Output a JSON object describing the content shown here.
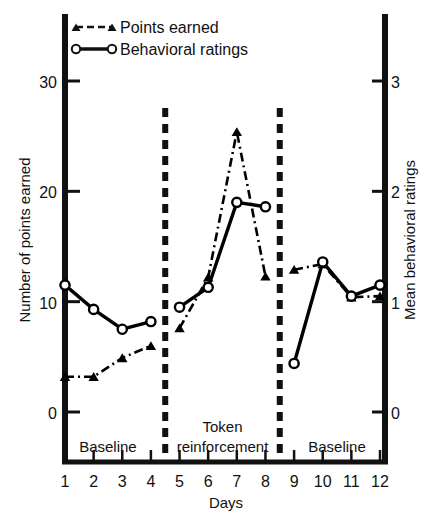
{
  "chart_data": {
    "type": "line",
    "title": "",
    "xlabel": "Days",
    "ylabel_left": "Number of points earned",
    "ylabel_right": "Mean behavioral ratings",
    "x": [
      1,
      2,
      3,
      4,
      5,
      6,
      7,
      8,
      9,
      10,
      11,
      12
    ],
    "xtick_labels": [
      "1",
      "2",
      "3",
      "4",
      "5",
      "6",
      "7",
      "8",
      "9",
      "10",
      "11",
      "12"
    ],
    "xlim": [
      0.6,
      12.4
    ],
    "ylim_left": [
      -1.5,
      34
    ],
    "ylim_right": [
      -0.15,
      3.4
    ],
    "ytick_labels_left": [
      "0",
      "10",
      "20",
      "30"
    ],
    "ytick_values_left": [
      0,
      10,
      20,
      30
    ],
    "ytick_labels_right": [
      "0",
      "1",
      "2",
      "3"
    ],
    "ytick_values_right": [
      0,
      1,
      2,
      3
    ],
    "grid": false,
    "legend_position": "top-left",
    "series": [
      {
        "name": "Points earned",
        "axis": "left",
        "marker": "triangle",
        "linestyle": "dash-dot",
        "color": "#000000",
        "values": [
          3.2,
          3.2,
          4.9,
          6.0,
          7.6,
          12.2,
          25.4,
          12.3,
          12.9,
          13.4,
          10.4,
          10.5
        ],
        "segments": [
          [
            1,
            2,
            3,
            4
          ],
          [
            5,
            6,
            7,
            8
          ],
          [
            9,
            10,
            11,
            12
          ]
        ]
      },
      {
        "name": "Behavioral ratings",
        "axis": "right",
        "marker": "circle",
        "linestyle": "solid",
        "color": "#000000",
        "values": [
          1.15,
          0.93,
          0.75,
          0.82,
          0.95,
          1.13,
          1.9,
          1.86,
          0.44,
          1.36,
          1.05,
          1.15
        ],
        "values_in_left_units": [
          11.4,
          9.2,
          7.5,
          8.2,
          9.5,
          11.3,
          19.0,
          18.7,
          4.4,
          13.6,
          10.5,
          11.5
        ],
        "segments": [
          [
            1,
            2,
            3,
            4
          ],
          [
            5,
            6,
            7,
            8
          ],
          [
            9,
            10,
            11,
            12
          ]
        ]
      }
    ],
    "phases": [
      {
        "label": "Baseline",
        "from": 1,
        "to": 4
      },
      {
        "label": "Token",
        "label2": "reinforcement",
        "from": 5,
        "to": 8
      },
      {
        "label": "Baseline",
        "from": 9,
        "to": 12
      }
    ],
    "dividers": [
      4.5,
      8.5
    ],
    "annotations": []
  },
  "legend": {
    "items": [
      {
        "label": "Points earned",
        "marker": "triangle",
        "linestyle": "dashed"
      },
      {
        "label": "Behavioral ratings",
        "marker": "circle",
        "linestyle": "solid"
      }
    ]
  },
  "colors": {
    "ink": "#111111",
    "background": "#ffffff"
  }
}
